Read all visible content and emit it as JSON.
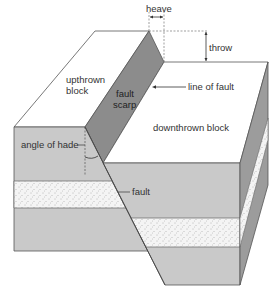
{
  "labels": {
    "heave": "heave",
    "throw": "throw",
    "upthrown_block_line1": "upthrown",
    "upthrown_block_line2": "block",
    "fault_scarp_line1": "fault",
    "fault_scarp_line2": "scarp",
    "line_of_fault": "line of fault",
    "downthrown_block": "downthrown block",
    "angle_of_hade": "angle of hade",
    "fault": "fault"
  },
  "colors": {
    "top_surface": "#ffffff",
    "front_face": "#c8c8c8",
    "scarp": "#8a8a8a",
    "side_face": "#9a9a9a",
    "sandstone": "#f2f2f2",
    "outline": "#555555"
  }
}
